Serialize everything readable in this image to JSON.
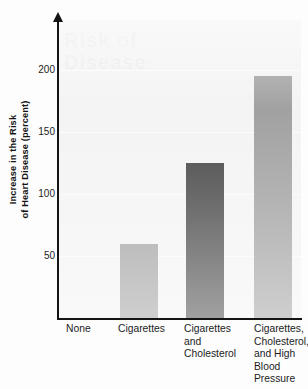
{
  "chart_data": {
    "type": "bar",
    "title": "",
    "subtitle": "",
    "xlabel": "",
    "ylabel": "Increase in the Risk of Heart Disease (percent)",
    "ylabel_lines": [
      "Increase in the Risk",
      "of Heart Disease (percent)"
    ],
    "categories": [
      "None",
      "Cigarettes",
      "Cigarettes and Cholesterol",
      "Cigarettes, Cholesterol, and High Blood Pressure"
    ],
    "category_label_lines": [
      [
        "None"
      ],
      [
        "Cigarettes"
      ],
      [
        "Cigarettes",
        "and",
        "Cholesterol"
      ],
      [
        "Cigarettes,",
        "Cholesterol,",
        "and High",
        "Blood",
        "Pressure"
      ]
    ],
    "values": [
      0,
      60,
      125,
      195
    ],
    "ylim": [
      0,
      240
    ],
    "yticks": [
      50,
      100,
      150,
      200
    ],
    "ytick_labels": [
      "50",
      "100",
      "150",
      "200"
    ],
    "grid": true,
    "legend": "none",
    "bar_colors": [
      "#f2f2f2",
      "#949494",
      "#2e2e2e",
      "#949494"
    ],
    "plot_background": "#f2f2f2",
    "axis_color": "#141414",
    "gridline_color": "#fbfbfb"
  },
  "ghost_watermark": {
    "line1": "Risk of",
    "line2": "Disease"
  }
}
